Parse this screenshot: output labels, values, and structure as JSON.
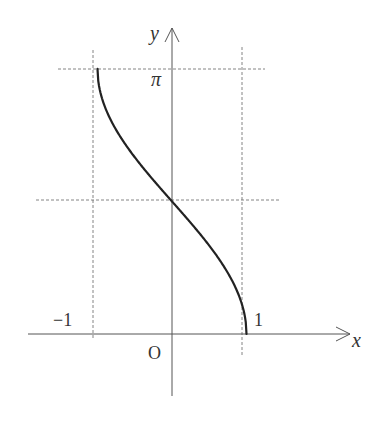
{
  "chart_data": {
    "type": "line",
    "title": "",
    "function": "y = arccos x",
    "xlabel": "x",
    "ylabel": "y",
    "origin_label": "O",
    "x_tick_labels": [
      "-1",
      "1"
    ],
    "y_tick_labels": [
      "π"
    ],
    "xlim": [
      -1,
      1
    ],
    "ylim": [
      0,
      3.14159
    ],
    "guide_lines": {
      "vertical": [
        -1,
        1
      ],
      "horizontal": [
        1.5708,
        3.14159
      ],
      "style": "dashed"
    },
    "series": [
      {
        "name": "arccos",
        "x": [
          -1,
          -0.9,
          -0.75,
          -0.5,
          -0.25,
          0,
          0.25,
          0.5,
          0.75,
          0.9,
          1
        ],
        "values": [
          3.1416,
          2.6906,
          2.4189,
          2.0944,
          1.8235,
          1.5708,
          1.3181,
          1.0472,
          0.7227,
          0.451,
          0
        ]
      }
    ],
    "grid": false,
    "legend": "none"
  },
  "labels": {
    "x_axis": "x",
    "y_axis": "y",
    "origin": "O",
    "neg_one": "−1",
    "pos_one": "1",
    "pi": "π"
  }
}
